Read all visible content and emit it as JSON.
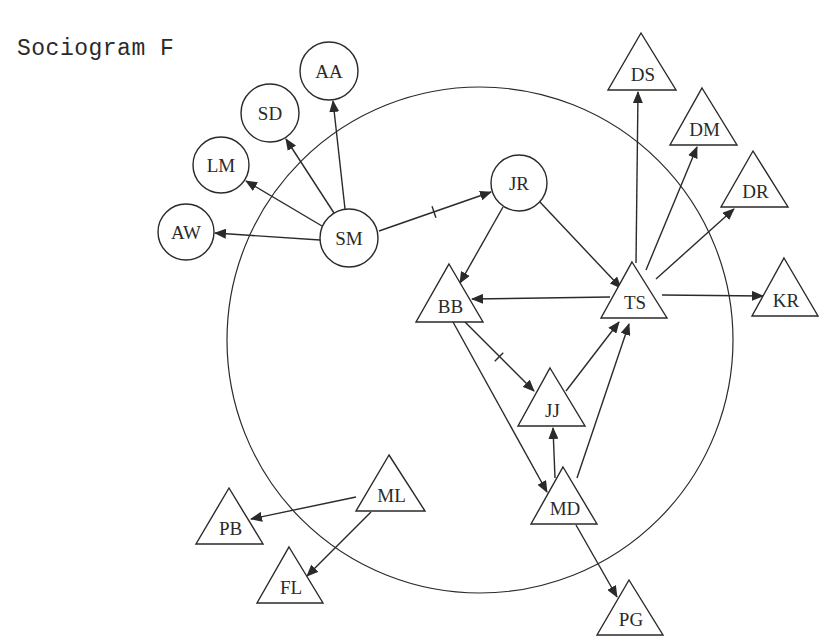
{
  "title": "Sociogram F",
  "colors": {
    "ink": "#2a2a2a",
    "background": "#ffffff"
  },
  "boundary": {
    "cx": 480,
    "cy": 340,
    "r": 253
  },
  "nodes": [
    {
      "id": "AA",
      "label": "AA",
      "shape": "circle",
      "x": 329,
      "y": 71,
      "r": 29
    },
    {
      "id": "SD",
      "label": "SD",
      "shape": "circle",
      "x": 270,
      "y": 113,
      "r": 29
    },
    {
      "id": "LM",
      "label": "LM",
      "shape": "circle",
      "x": 221,
      "y": 165,
      "r": 28
    },
    {
      "id": "AW",
      "label": "AW",
      "shape": "circle",
      "x": 186,
      "y": 232,
      "r": 28
    },
    {
      "id": "SM",
      "label": "SM",
      "shape": "circle",
      "x": 349,
      "y": 238,
      "r": 29
    },
    {
      "id": "JR",
      "label": "JR",
      "shape": "circle",
      "x": 519,
      "y": 183,
      "r": 28
    },
    {
      "id": "DS",
      "label": "DS",
      "shape": "triangle",
      "apex": [
        641,
        33
      ],
      "base_y": 90,
      "left": 608,
      "right": 676
    },
    {
      "id": "DM",
      "label": "DM",
      "shape": "triangle",
      "apex": [
        702,
        88
      ],
      "base_y": 145,
      "left": 670,
      "right": 737
    },
    {
      "id": "DR",
      "label": "DR",
      "shape": "triangle",
      "apex": [
        753,
        151
      ],
      "base_y": 207,
      "left": 721,
      "right": 788
    },
    {
      "id": "BB",
      "label": "BB",
      "shape": "triangle",
      "apex": [
        449,
        264
      ],
      "base_y": 322,
      "left": 416,
      "right": 483
    },
    {
      "id": "TS",
      "label": "TS",
      "shape": "triangle",
      "apex": [
        632,
        262
      ],
      "base_y": 318,
      "left": 601,
      "right": 667
    },
    {
      "id": "KR",
      "label": "KR",
      "shape": "triangle",
      "apex": [
        784,
        258
      ],
      "base_y": 316,
      "left": 752,
      "right": 818
    },
    {
      "id": "JJ",
      "label": "JJ",
      "shape": "triangle",
      "apex": [
        550,
        368
      ],
      "base_y": 426,
      "left": 518,
      "right": 585
    },
    {
      "id": "MD",
      "label": "MD",
      "shape": "triangle",
      "apex": [
        563,
        467
      ],
      "base_y": 524,
      "left": 531,
      "right": 597
    },
    {
      "id": "ML",
      "label": "ML",
      "shape": "triangle",
      "apex": [
        389,
        455
      ],
      "base_y": 511,
      "left": 356,
      "right": 425
    },
    {
      "id": "PB",
      "label": "PB",
      "shape": "triangle",
      "apex": [
        229,
        488
      ],
      "base_y": 544,
      "left": 196,
      "right": 263
    },
    {
      "id": "FL",
      "label": "FL",
      "shape": "triangle",
      "apex": [
        289,
        547
      ],
      "base_y": 603,
      "left": 257,
      "right": 323
    },
    {
      "id": "PG",
      "label": "PG",
      "shape": "triangle",
      "apex": [
        629,
        580
      ],
      "base_y": 635,
      "left": 597,
      "right": 663
    }
  ],
  "edges": [
    {
      "from": "SM",
      "to": "AA",
      "x1": 345,
      "y1": 209,
      "x2": 333,
      "y2": 101
    },
    {
      "from": "SM",
      "to": "SD",
      "x1": 334,
      "y1": 213,
      "x2": 286,
      "y2": 139
    },
    {
      "from": "SM",
      "to": "LM",
      "x1": 322,
      "y1": 226,
      "x2": 246,
      "y2": 181
    },
    {
      "from": "SM",
      "to": "AW",
      "x1": 320,
      "y1": 240,
      "x2": 215,
      "y2": 233
    },
    {
      "from": "SM",
      "to": "JR",
      "x1": 379,
      "y1": 231,
      "x2": 491,
      "y2": 192,
      "tick": [
        434,
        212
      ]
    },
    {
      "from": "JR",
      "to": "BB",
      "x1": 503,
      "y1": 207,
      "x2": 460,
      "y2": 283
    },
    {
      "from": "JR",
      "to": "TS",
      "x1": 539,
      "y1": 201,
      "x2": 621,
      "y2": 288
    },
    {
      "from": "TS",
      "to": "BB",
      "x1": 610,
      "y1": 297,
      "x2": 472,
      "y2": 299
    },
    {
      "from": "TS",
      "to": "KR",
      "x1": 662,
      "y1": 295,
      "x2": 763,
      "y2": 296
    },
    {
      "from": "TS",
      "to": "DS",
      "x1": 636,
      "y1": 263,
      "x2": 638,
      "y2": 92
    },
    {
      "from": "TS",
      "to": "DM",
      "x1": 646,
      "y1": 270,
      "x2": 697,
      "y2": 147
    },
    {
      "from": "TS",
      "to": "DR",
      "x1": 656,
      "y1": 279,
      "x2": 734,
      "y2": 209
    },
    {
      "from": "BB",
      "to": "JJ",
      "x1": 465,
      "y1": 322,
      "x2": 534,
      "y2": 391,
      "tick": [
        499,
        357
      ]
    },
    {
      "from": "BB",
      "to": "MD",
      "x1": 453,
      "y1": 322,
      "x2": 547,
      "y2": 492
    },
    {
      "from": "JJ",
      "to": "TS",
      "x1": 566,
      "y1": 391,
      "x2": 619,
      "y2": 322
    },
    {
      "from": "MD",
      "to": "TS",
      "x1": 577,
      "y1": 478,
      "x2": 629,
      "y2": 324
    },
    {
      "from": "MD",
      "to": "JJ",
      "x1": 555,
      "y1": 478,
      "x2": 553,
      "y2": 428
    },
    {
      "from": "MD",
      "to": "PG",
      "x1": 576,
      "y1": 525,
      "x2": 617,
      "y2": 597
    },
    {
      "from": "ML",
      "to": "PB",
      "x1": 356,
      "y1": 497,
      "x2": 251,
      "y2": 519
    },
    {
      "from": "ML",
      "to": "FL",
      "x1": 371,
      "y1": 512,
      "x2": 307,
      "y2": 576
    }
  ]
}
